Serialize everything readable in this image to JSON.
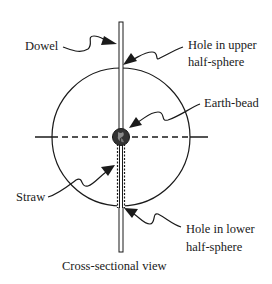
{
  "diagram": {
    "caption": "Cross-sectional view",
    "labels": {
      "dowel": "Dowel",
      "upper_hole_line1": "Hole in upper",
      "upper_hole_line2": "half-sphere",
      "earth_bead": "Earth-bead",
      "straw": "Straw",
      "lower_hole_line1": "Hole in lower",
      "lower_hole_line2": "half-sphere"
    },
    "colors": {
      "ink": "#1a1a1a",
      "bead": "#333333",
      "background": "#ffffff"
    }
  }
}
